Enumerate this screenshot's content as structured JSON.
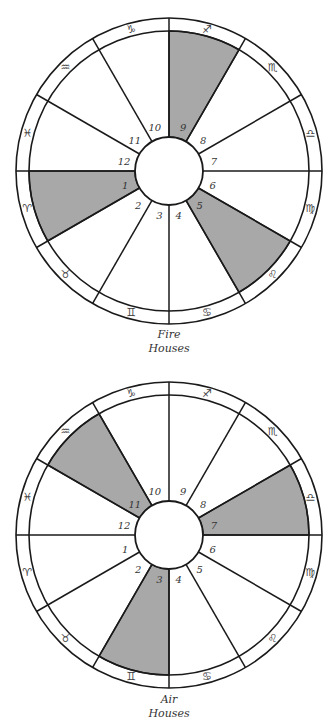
{
  "colors": {
    "line": "#1a1a1a",
    "shade": "#a8a8a8",
    "background": "#ffffff"
  },
  "zodiac_signs": [
    {
      "name": "Aries",
      "glyph": "♈",
      "angle": 195
    },
    {
      "name": "Taurus",
      "glyph": "♉",
      "angle": 225
    },
    {
      "name": "Gemini",
      "glyph": "♊",
      "angle": 255
    },
    {
      "name": "Cancer",
      "glyph": "♋",
      "angle": 285
    },
    {
      "name": "Leo",
      "glyph": "♌",
      "angle": 315
    },
    {
      "name": "Virgo",
      "glyph": "♍",
      "angle": 345
    },
    {
      "name": "Libra",
      "glyph": "♎",
      "angle": 15
    },
    {
      "name": "Scorpio",
      "glyph": "♏",
      "angle": 45
    },
    {
      "name": "Sagittarius",
      "glyph": "♐",
      "angle": 75
    },
    {
      "name": "Capricorn",
      "glyph": "♑",
      "angle": 105
    },
    {
      "name": "Aquarius",
      "glyph": "♒",
      "angle": 135
    },
    {
      "name": "Pisces",
      "glyph": "♓",
      "angle": 165
    }
  ],
  "houses": [
    {
      "label": "1",
      "angle": 195
    },
    {
      "label": "2",
      "angle": 225
    },
    {
      "label": "3",
      "angle": 255
    },
    {
      "label": "4",
      "angle": 285
    },
    {
      "label": "5",
      "angle": 315
    },
    {
      "label": "6",
      "angle": 345
    },
    {
      "label": "7",
      "angle": 15
    },
    {
      "label": "8",
      "angle": 45
    },
    {
      "label": "9",
      "angle": 75
    },
    {
      "label": "10",
      "angle": 105
    },
    {
      "label": "11",
      "angle": 135
    },
    {
      "label": "12",
      "angle": 165
    }
  ],
  "charts": [
    {
      "id": "fire",
      "caption_line1": "Fire",
      "caption_line2": "Houses",
      "center": [
        169,
        171
      ],
      "shaded_houses": [
        "1",
        "5",
        "9"
      ]
    },
    {
      "id": "air",
      "caption_line1": "Air",
      "caption_line2": "Houses",
      "center": [
        169,
        535
      ],
      "shaded_houses": [
        "3",
        "7",
        "11"
      ]
    }
  ],
  "geometry": {
    "outer_radius": 153,
    "inner_ring_radius": 140,
    "hub_radius": 34,
    "house_label_radius": 44,
    "sign_radius": 146.5
  }
}
